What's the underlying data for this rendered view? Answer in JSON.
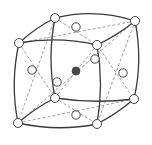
{
  "diagram": {
    "colors": {
      "edge": "#3a3a3a",
      "dashed": "#8a8a8a",
      "atom_fill": "#ffffff",
      "center_atom_fill": "#4a4a4a"
    },
    "corners": [
      {
        "id": "front-top-left",
        "x": 19,
        "y": 43
      },
      {
        "id": "front-top-right",
        "x": 97,
        "y": 45
      },
      {
        "id": "front-bottom-left",
        "x": 18,
        "y": 123
      },
      {
        "id": "front-bottom-right",
        "x": 97,
        "y": 124
      },
      {
        "id": "back-top-left",
        "x": 55,
        "y": 18
      },
      {
        "id": "back-top-right",
        "x": 135,
        "y": 21
      },
      {
        "id": "back-bottom-left",
        "x": 55,
        "y": 98
      },
      {
        "id": "back-bottom-right",
        "x": 134,
        "y": 99
      }
    ],
    "face_centers": [
      {
        "id": "top",
        "x": 76,
        "y": 27
      },
      {
        "id": "left",
        "x": 32,
        "y": 70
      },
      {
        "id": "right",
        "x": 123,
        "y": 73
      },
      {
        "id": "bottom",
        "x": 76,
        "y": 115
      },
      {
        "id": "front",
        "x": 95,
        "y": 59
      },
      {
        "id": "back",
        "x": 57,
        "y": 82
      }
    ],
    "body_center": {
      "x": 76,
      "y": 71
    }
  }
}
